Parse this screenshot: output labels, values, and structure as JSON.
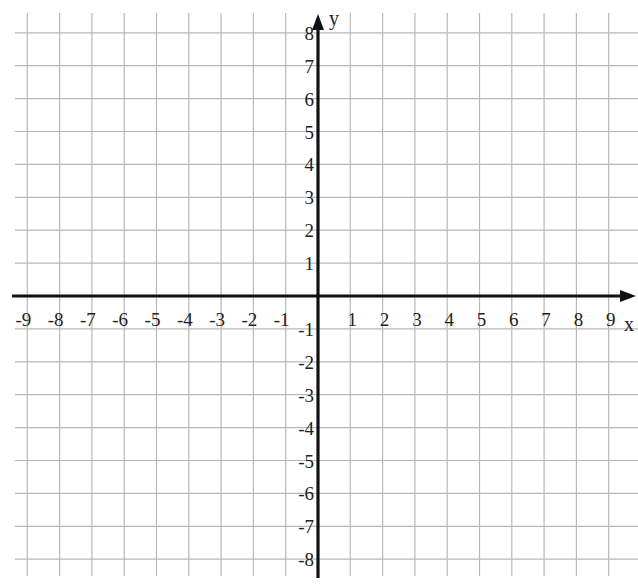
{
  "chart_data": {
    "type": "coordinate-grid",
    "title": "",
    "xlabel": "x",
    "ylabel": "y",
    "xlim": [
      -9,
      9
    ],
    "ylim": [
      -8,
      8
    ],
    "grid": true,
    "x_ticks": [
      -9,
      -8,
      -7,
      -6,
      -5,
      -4,
      -3,
      -2,
      -1,
      1,
      2,
      3,
      4,
      5,
      6,
      7,
      8,
      9
    ],
    "y_ticks": [
      8,
      7,
      6,
      5,
      4,
      3,
      2,
      1,
      -1,
      -2,
      -3,
      -4,
      -5,
      -6,
      -7,
      -8
    ],
    "series": [],
    "legend": null
  },
  "colors": {
    "grid": "#b8b8b8",
    "axis": "#111111",
    "text": "#222222",
    "background": "#ffffff"
  }
}
